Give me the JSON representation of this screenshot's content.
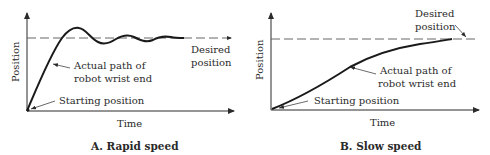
{
  "panels": [
    {
      "id": "A",
      "caption": "A. Rapid speed",
      "y_axis_label": "Position",
      "x_axis_label": "Time",
      "annotations": {
        "desired_line1": "Desired",
        "desired_line2": "position",
        "path_line1": "Actual path of",
        "path_line2": "robot wrist end",
        "start": "Starting position"
      }
    },
    {
      "id": "B",
      "caption": "B. Slow speed",
      "y_axis_label": "Position",
      "x_axis_label": "Time",
      "annotations": {
        "desired_line1": "Desired",
        "desired_line2": "position",
        "path_line1": "Actual path of",
        "path_line2": "robot wrist end",
        "start": "Starting position"
      }
    }
  ],
  "colors": {
    "ink": "#2a2a2a",
    "dashed": "#555555"
  }
}
